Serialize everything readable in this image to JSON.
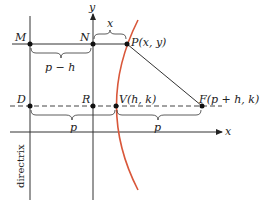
{
  "diagram": {
    "colors": {
      "curve": "#d9573a",
      "lines": "#333333",
      "text": "#222222"
    },
    "axes": {
      "x_label": "x",
      "y_label": "y"
    },
    "points": {
      "M": "M",
      "N": "N",
      "P": "P(x, y)",
      "D": "D",
      "R": "R",
      "V": "V(h, k)",
      "F": "F(p + h, k)"
    },
    "braces": {
      "top_x": "x",
      "m_to_n": "p − h",
      "d_to_v": "p",
      "v_to_f": "p"
    },
    "directrix_label": "directrix"
  }
}
